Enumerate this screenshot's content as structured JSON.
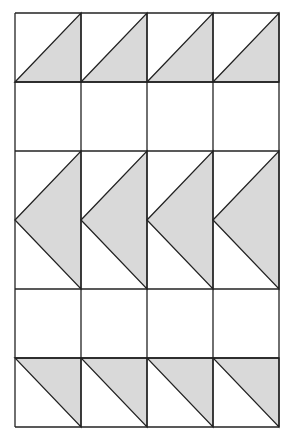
{
  "colors": {
    "fill": "#d9d9d9",
    "stroke": "#222222",
    "background": "#ffffff"
  },
  "grid": {
    "columns": 4,
    "rows": [
      {
        "name": "top-triangles",
        "span": 1,
        "shape": "lower-right-triangle"
      },
      {
        "name": "blank-row-1",
        "span": 1,
        "shape": "none"
      },
      {
        "name": "arrow-triangles",
        "span": 2,
        "shape": "left-pointing-triangle"
      },
      {
        "name": "blank-row-2",
        "span": 1,
        "shape": "none"
      },
      {
        "name": "bottom-triangles",
        "span": 1,
        "shape": "upper-right-triangle"
      }
    ]
  }
}
